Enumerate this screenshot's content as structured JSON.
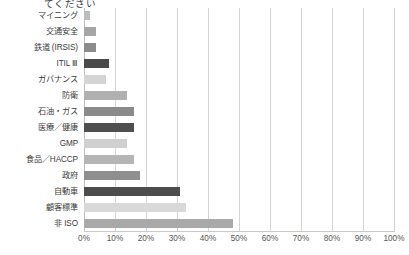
{
  "title_fragment": "てください",
  "axis": {
    "x_ticks": [
      "0%",
      "10%",
      "20%",
      "30%",
      "40%",
      "50%",
      "60%",
      "70%",
      "80%",
      "90%",
      "100%"
    ],
    "x_min": 0,
    "x_max": 100,
    "x_step": 10
  },
  "chart_data": {
    "type": "bar",
    "orientation": "horizontal",
    "title": "てください",
    "xlabel": "",
    "ylabel": "",
    "xlim": [
      0,
      100
    ],
    "xticks": [
      0,
      10,
      20,
      30,
      40,
      50,
      60,
      70,
      80,
      90,
      100
    ],
    "xtick_labels": [
      "0%",
      "10%",
      "20%",
      "30%",
      "40%",
      "50%",
      "60%",
      "70%",
      "80%",
      "90%",
      "100%"
    ],
    "grid": true,
    "grid_axis": "x",
    "legend": false,
    "categories": [
      "マイニング",
      "交通安全",
      "鉄道 (IRSIS)",
      "ITIL Ⅲ",
      "ガバナンス",
      "防衛",
      "石油・ガス",
      "医療／健康",
      "GMP",
      "食品／HACCP",
      "政府",
      "自動車",
      "顧客標準",
      "非 ISO"
    ],
    "values": [
      2,
      4,
      4,
      8,
      7,
      14,
      16,
      16,
      14,
      16,
      18,
      31,
      33,
      48
    ],
    "bar_colors": [
      "#bdbdbd",
      "#a6a6a6",
      "#8c8c8c",
      "#4a4a4a",
      "#d4d4d4",
      "#b0b0b0",
      "#8a8a8a",
      "#4f4f4f",
      "#d0d0d0",
      "#b5b5b5",
      "#8f8f8f",
      "#4d4d4d",
      "#d9d9d9",
      "#a9a9a9"
    ]
  }
}
